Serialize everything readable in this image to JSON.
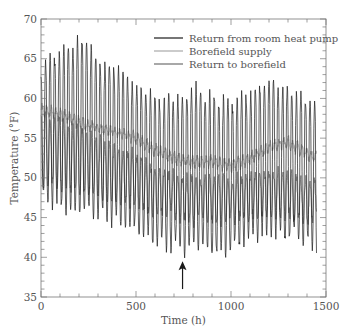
{
  "chart_data": {
    "type": "line",
    "title": "",
    "xlabel": "Time (h)",
    "ylabel": "Temperature (°F)",
    "xlim": [
      0,
      1500
    ],
    "ylim": [
      35,
      70
    ],
    "x_ticks": [
      0,
      500,
      1000,
      1500
    ],
    "x_tick_labels": [
      "0",
      "500",
      "1000",
      "1500"
    ],
    "x_minor_step": 100,
    "y_ticks": [
      35,
      40,
      45,
      50,
      55,
      60,
      65,
      70
    ],
    "y_tick_labels": [
      "35",
      "40",
      "45",
      "50",
      "55",
      "60",
      "65",
      "70"
    ],
    "y_minor_step": 1,
    "grid": false,
    "legend_position": "upper right",
    "period_hours": 24,
    "data_end_hour": 1450,
    "annotation": {
      "type": "arrow",
      "x": 745,
      "y_from": 36.0,
      "y_to": 39.5,
      "label": ""
    },
    "series": [
      {
        "name": "Return from room heat pump",
        "color": "#1a1a1a",
        "width": 0.7,
        "envelope": {
          "hours": [
            0,
            50,
            150,
            235,
            300,
            400,
            500,
            600,
            750,
            800,
            900,
            1000,
            1100,
            1190,
            1300,
            1400,
            1450
          ],
          "max": [
            64.5,
            65.5,
            67.0,
            67.9,
            65.0,
            64.5,
            62.0,
            60.5,
            60.5,
            62.0,
            60.5,
            60.0,
            61.0,
            62.8,
            61.5,
            60.5,
            59.5
          ],
          "min": [
            47.0,
            46.5,
            45.5,
            45.0,
            44.5,
            44.0,
            43.0,
            41.5,
            40.3,
            40.8,
            40.0,
            40.3,
            42.0,
            42.5,
            42.0,
            41.5,
            40.3
          ]
        }
      },
      {
        "name": "Borefield supply",
        "color": "#a8a8a8",
        "width": 0.9,
        "envelope": {
          "hours": [
            0,
            100,
            200,
            300,
            400,
            500,
            600,
            700,
            800,
            900,
            1000,
            1100,
            1200,
            1300,
            1400,
            1450
          ],
          "max": [
            59.5,
            59.0,
            58.0,
            57.0,
            56.5,
            56.0,
            54.5,
            53.5,
            53.0,
            53.0,
            52.5,
            53.5,
            54.8,
            55.5,
            54.0,
            53.5
          ],
          "min": [
            57.5,
            57.0,
            56.0,
            55.5,
            55.0,
            54.0,
            52.5,
            51.5,
            51.0,
            51.0,
            50.5,
            51.5,
            53.0,
            53.5,
            52.0,
            51.5
          ]
        }
      },
      {
        "name": "Return to borefield",
        "color": "#6e6e6e",
        "width": 0.8,
        "envelope": {
          "hours": [
            0,
            100,
            200,
            300,
            400,
            500,
            600,
            700,
            800,
            900,
            1000,
            1100,
            1200,
            1300,
            1400,
            1450
          ],
          "max": [
            58.0,
            57.5,
            56.5,
            55.0,
            54.0,
            53.0,
            51.5,
            50.5,
            50.0,
            50.0,
            50.0,
            50.5,
            51.0,
            50.5,
            50.0,
            49.5
          ],
          "min": [
            49.0,
            48.5,
            48.0,
            47.5,
            47.0,
            46.5,
            45.5,
            45.0,
            44.5,
            44.5,
            44.5,
            45.0,
            45.5,
            45.0,
            44.5,
            44.5
          ]
        }
      }
    ]
  },
  "axes": {
    "xlabel": "Time (h)",
    "ylabel": "Temperature (°F)"
  },
  "legend": {
    "items": [
      {
        "label": "Return from room heat pump",
        "color": "#1a1a1a"
      },
      {
        "label": "Borefield supply",
        "color": "#a8a8a8"
      },
      {
        "label": "Return to borefield",
        "color": "#6e6e6e"
      }
    ]
  },
  "colors": {
    "axis": "#777777",
    "text": "#555555",
    "background": "#ffffff"
  }
}
